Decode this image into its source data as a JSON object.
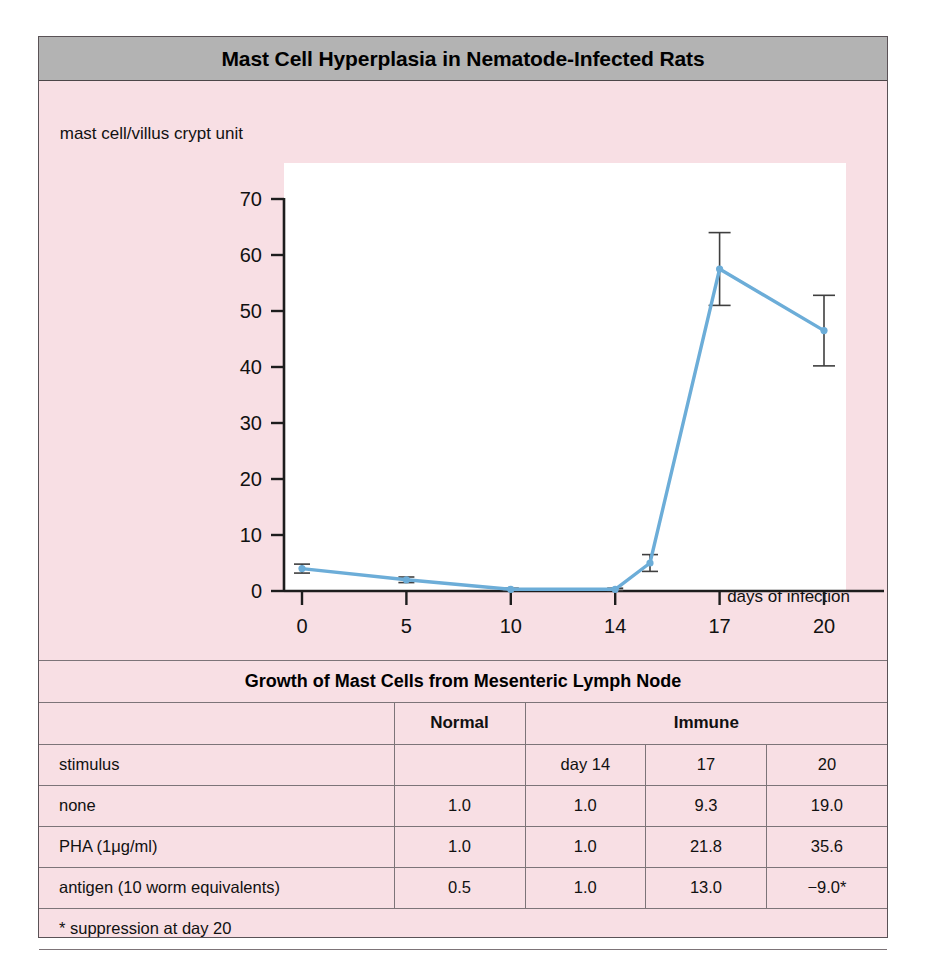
{
  "figure": {
    "title": "Mast Cell Hyperplasia in Nematode-Infected Rats",
    "panel_bg": "#f8dfe4",
    "title_bar_bg": "#b3b3b3",
    "line_color": "#6cadd8",
    "error_bar_color": "#3f3f3f"
  },
  "chart_data": {
    "type": "line",
    "title": "Mast Cell Hyperplasia in Nematode-Infected Rats",
    "xlabel": "days of infection",
    "ylabel": "mast cell/villus crypt unit",
    "x_ticks": [
      0,
      5,
      10,
      14,
      17,
      20
    ],
    "x_tick_labels": [
      "0",
      "5",
      "10",
      "14",
      "17",
      "20"
    ],
    "y_ticks": [
      0,
      10,
      20,
      30,
      40,
      50,
      60,
      70
    ],
    "y_tick_labels": [
      "0",
      "10",
      "20",
      "30",
      "40",
      "50",
      "60",
      "70"
    ],
    "ylim": [
      0,
      70
    ],
    "grid": false,
    "legend": "none",
    "series": [
      {
        "name": "mast cells per villus crypt unit",
        "x": [
          0,
          5,
          10,
          14,
          15,
          17,
          20
        ],
        "values": [
          4.0,
          2.0,
          0.3,
          0.3,
          5.0,
          57.5,
          46.5
        ],
        "errors": [
          0.8,
          0.5,
          0.2,
          0.2,
          1.5,
          6.5,
          6.3
        ]
      }
    ]
  },
  "table": {
    "title": "Growth of Mast Cells from Mesenteric Lymph Node",
    "group_headers": {
      "stimulus_blank": "",
      "normal": "Normal",
      "immune": "Immune"
    },
    "column_headers": [
      "stimulus",
      "",
      "day 14",
      "17",
      "20"
    ],
    "rows": [
      {
        "label": "none",
        "normal": "1.0",
        "day14": "1.0",
        "day17": "9.3",
        "day20": "19.0"
      },
      {
        "label": "PHA   (1μg/ml)",
        "normal": "1.0",
        "day14": "1.0",
        "day17": "21.8",
        "day20": "35.6"
      },
      {
        "label": "antigen  (10 worm equivalents)",
        "normal": "0.5",
        "day14": "1.0",
        "day17": "13.0",
        "day20": "−9.0*"
      }
    ],
    "footnote": "* suppression at day 20"
  }
}
